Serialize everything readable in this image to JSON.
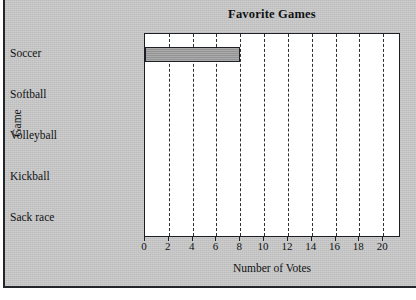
{
  "chart_data": {
    "type": "bar",
    "orientation": "horizontal",
    "title": "Favorite Games",
    "xlabel": "Number of Votes",
    "ylabel": "Game",
    "categories": [
      "Soccer",
      "Softball",
      "Volleyball",
      "Kickball",
      "Sack race"
    ],
    "values": [
      8,
      0,
      0,
      0,
      0
    ],
    "xlim": [
      0,
      21.5
    ],
    "xticks": [
      0,
      2,
      4,
      6,
      8,
      10,
      12,
      14,
      16,
      18,
      20
    ],
    "xtick_labels": [
      "0",
      "2",
      "4",
      "6",
      "8",
      "10",
      "12",
      "14",
      "16",
      "18",
      "20"
    ],
    "grid": "vertical-dashed",
    "legend": "none",
    "bar_fill_color": "#9b9b9b",
    "bar_edge_color": "#1c1f24",
    "plot_background": "#ffffff",
    "figure_background": "#c9c9c9",
    "gridline_color": "#2a2d32"
  }
}
